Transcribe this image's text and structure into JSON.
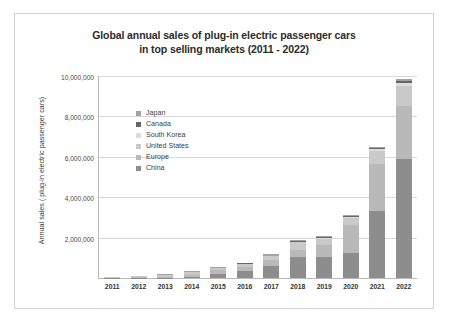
{
  "chart_data": {
    "type": "bar",
    "stacked": true,
    "title": "Global annual sales of plug-in electric passenger cars in top selling markets (2011 - 2022)",
    "title_lines": [
      "Global annual sales of plug-in electric passenger cars",
      "in top selling markets (2011 - 2022)"
    ],
    "xlabel": "",
    "ylabel": "Annual sales ( plug-in electric passenger cars)",
    "categories": [
      "2011",
      "2012",
      "2013",
      "2014",
      "2015",
      "2016",
      "2017",
      "2018",
      "2019",
      "2020",
      "2021",
      "2022"
    ],
    "ylim": [
      0,
      10000000
    ],
    "ytick_values": [
      2000000,
      4000000,
      6000000,
      8000000,
      10000000
    ],
    "ytick_labels": [
      "2,000,000",
      "4,000,000",
      "6,000,000",
      "8,000,000",
      "10,000,000"
    ],
    "grid": true,
    "legend_position": "inside-upper-left",
    "series": [
      {
        "name": "China",
        "color": "#8d8d8d",
        "values": [
          8000,
          12000,
          18000,
          75000,
          207000,
          336000,
          579000,
          1016000,
          1060000,
          1246000,
          3334000,
          5907000
        ]
      },
      {
        "name": "Europe",
        "color": "#b9b9b9",
        "values": [
          12000,
          27000,
          48000,
          97000,
          192000,
          215000,
          306000,
          386000,
          564000,
          1395000,
          2300000,
          2600000
        ]
      },
      {
        "name": "United States",
        "color": "#c9c9c9",
        "values": [
          18000,
          53000,
          97000,
          119000,
          114000,
          159000,
          195000,
          361000,
          326000,
          328000,
          630000,
          990000
        ]
      },
      {
        "name": "South Korea",
        "color": "#dcdcdc",
        "values": [
          400,
          800,
          1200,
          1500,
          3000,
          5000,
          14000,
          32000,
          35000,
          47000,
          100000,
          160000
        ]
      },
      {
        "name": "Canada",
        "color": "#666666",
        "values": [
          500,
          1100,
          1800,
          5000,
          6000,
          11000,
          18000,
          44000,
          51000,
          54000,
          86000,
          120000
        ]
      },
      {
        "name": "Japan",
        "color": "#a3a3a3",
        "values": [
          13000,
          25000,
          28000,
          33000,
          46000,
          24000,
          56000,
          52000,
          44000,
          30000,
          45000,
          100000
        ]
      }
    ],
    "legend": [
      {
        "label": "Japan",
        "color": "#a3a3a3"
      },
      {
        "label": "Canada",
        "color": "#666666"
      },
      {
        "label": "South Korea",
        "color": "#dcdcdc"
      },
      {
        "label": "United States",
        "color": "#c9c9c9"
      },
      {
        "label": "Europe",
        "color": "#b9b9b9"
      },
      {
        "label": "China",
        "color": "#8d8d8d"
      }
    ]
  }
}
